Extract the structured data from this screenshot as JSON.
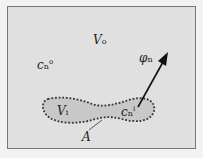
{
  "diagram": {
    "labels": {
      "outer_volume": {
        "main": "V",
        "sub": "o"
      },
      "inner_volume": {
        "main": "V",
        "sub": "i"
      },
      "outer_conc": {
        "main": "c",
        "sub": "n",
        "sup": "o"
      },
      "inner_conc": {
        "main": "c",
        "sub": "n",
        "sup": "i"
      },
      "flux": {
        "main": "φ",
        "sub": "n"
      },
      "area": {
        "main": "A"
      }
    },
    "colors": {
      "background": "#e0e0e0",
      "inner_fill": "#c8c8c8",
      "boundary": "#333333"
    }
  }
}
